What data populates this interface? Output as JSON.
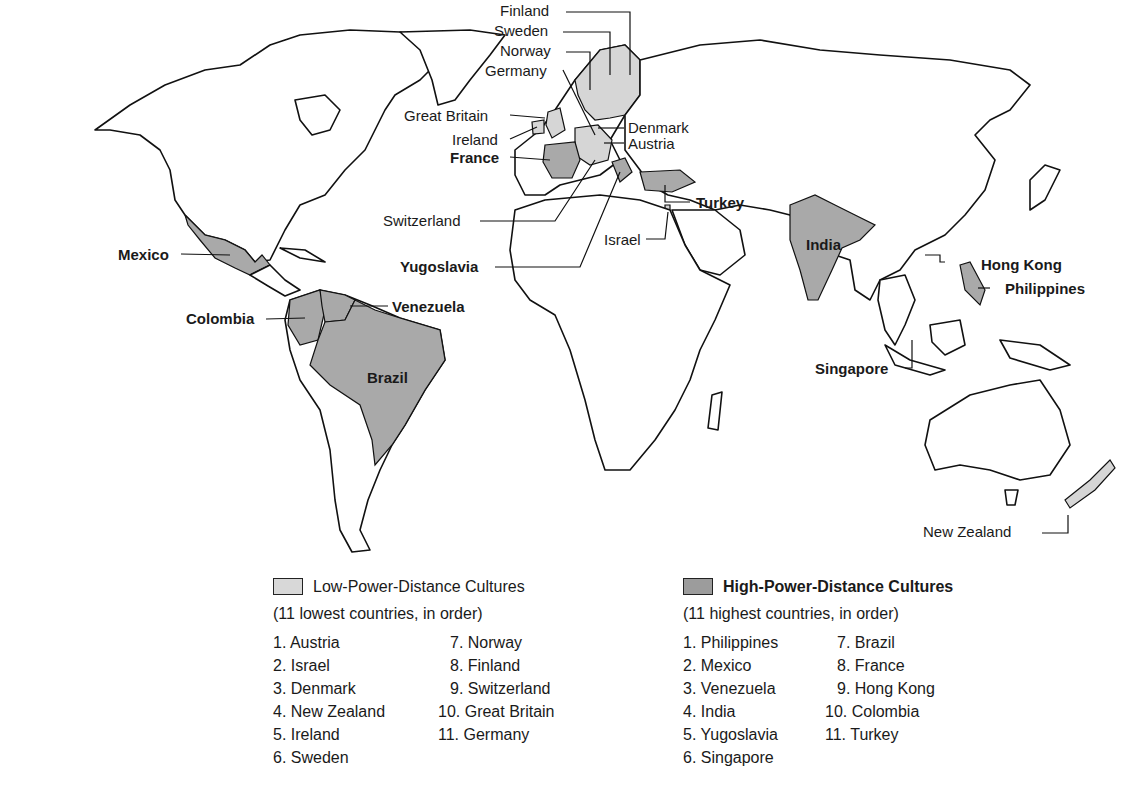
{
  "map_labels": {
    "finland": "Finland",
    "sweden": "Sweden",
    "norway": "Norway",
    "germany": "Germany",
    "great_britain": "Great Britain",
    "ireland": "Ireland",
    "france": "France",
    "denmark": "Denmark",
    "austria": "Austria",
    "switzerland": "Switzerland",
    "turkey": "Turkey",
    "israel": "Israel",
    "yugoslavia": "Yugoslavia",
    "mexico": "Mexico",
    "colombia": "Colombia",
    "venezuela": "Venezuela",
    "brazil": "Brazil",
    "india": "India",
    "hong_kong": "Hong Kong",
    "philippines": "Philippines",
    "singapore": "Singapore",
    "new_zealand": "New Zealand"
  },
  "colors": {
    "low_power_distance": "#d6d6d6",
    "high_power_distance": "#a9a9a9",
    "outline": "#111111"
  },
  "legend": {
    "low": {
      "title": "Low-Power-Distance Cultures",
      "subtitle": "(11 lowest countries, in order)",
      "col1": [
        "1. Austria",
        "2. Israel",
        "3. Denmark",
        "4. New Zealand",
        "5. Ireland",
        "6. Sweden"
      ],
      "col2": [
        "7. Norway",
        "8. Finland",
        "9. Switzerland",
        "10. Great Britain",
        "11. Germany"
      ]
    },
    "high": {
      "title": "High-Power-Distance Cultures",
      "subtitle": "(11 highest countries, in order)",
      "col1": [
        "1. Philippines",
        "2. Mexico",
        "3. Venezuela",
        "4. India",
        "5. Yugoslavia",
        "6. Singapore"
      ],
      "col2": [
        "7. Brazil",
        "8. France",
        "9. Hong Kong",
        "10. Colombia",
        "11. Turkey"
      ]
    }
  }
}
